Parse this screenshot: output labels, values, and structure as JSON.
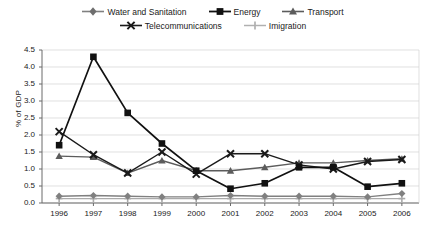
{
  "chart_data": {
    "type": "line",
    "title": "",
    "xlabel": "",
    "ylabel": "% of GDP",
    "categories": [
      "1996",
      "1997",
      "1998",
      "1999",
      "2000",
      "2001",
      "2002",
      "2003",
      "2004",
      "2005",
      "2006"
    ],
    "x": [
      1996,
      1997,
      1998,
      1999,
      2000,
      2001,
      2002,
      2003,
      2004,
      2005,
      2006
    ],
    "ylim": [
      0.0,
      4.5
    ],
    "yticks": [
      "0.0",
      "0.5",
      "1.0",
      "1.5",
      "2.0",
      "2.5",
      "3.0",
      "3.5",
      "4.0",
      "4.5"
    ],
    "ytick_values": [
      0.0,
      0.5,
      1.0,
      1.5,
      2.0,
      2.5,
      3.0,
      3.5,
      4.0,
      4.5
    ],
    "grid": true,
    "legend_position": "top",
    "series": [
      {
        "name": "Water and Sanitation",
        "marker": "diamond",
        "color": "#808080",
        "values": [
          0.2,
          0.22,
          0.2,
          0.18,
          0.18,
          0.22,
          0.2,
          0.2,
          0.2,
          0.18,
          0.28
        ]
      },
      {
        "name": "Energy",
        "marker": "square",
        "color": "#111111",
        "values": [
          1.7,
          4.3,
          2.65,
          1.75,
          0.95,
          0.42,
          0.58,
          1.05,
          1.05,
          0.48,
          0.58
        ]
      },
      {
        "name": "Transport",
        "marker": "triangle",
        "color": "#5c5c5c",
        "values": [
          1.38,
          1.35,
          0.88,
          1.25,
          0.95,
          0.95,
          1.05,
          1.18,
          1.18,
          1.25,
          1.3
        ]
      },
      {
        "name": "Telecommunications",
        "marker": "cross-x",
        "color": "#1a1a1a",
        "values": [
          2.1,
          1.42,
          0.88,
          1.5,
          0.85,
          1.45,
          1.45,
          1.12,
          1.0,
          1.22,
          1.28
        ]
      },
      {
        "name": "Imigration",
        "marker": "plus",
        "color": "#aaaaaa",
        "values": [
          0.13,
          0.13,
          0.13,
          0.13,
          0.13,
          0.13,
          0.13,
          0.13,
          0.13,
          0.13,
          0.13
        ]
      }
    ]
  },
  "legend": {
    "row1": [
      {
        "label": "Water and Sanitation",
        "icon": "diamond-marker-icon"
      },
      {
        "label": "Energy",
        "icon": "square-marker-icon"
      },
      {
        "label": "Transport",
        "icon": "triangle-marker-icon"
      }
    ],
    "row2": [
      {
        "label": "Telecommunications",
        "icon": "cross-marker-icon"
      },
      {
        "label": "Imigration",
        "icon": "plus-marker-icon"
      }
    ]
  }
}
